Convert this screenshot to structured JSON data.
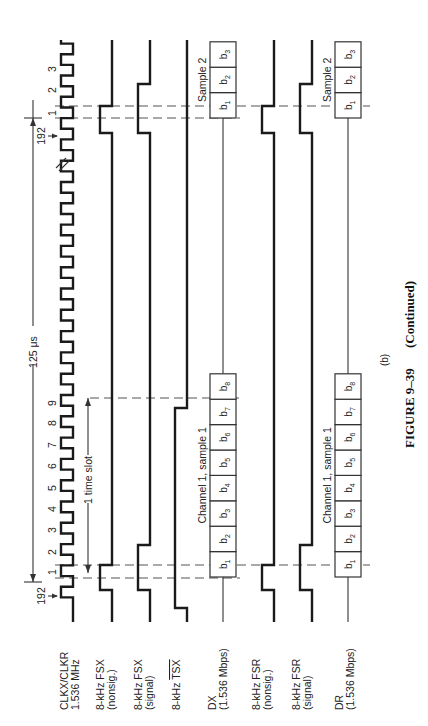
{
  "figure": {
    "caption_number": "FIGURE 9–39",
    "caption_suffix": "(Continued)",
    "part_label": "(b)",
    "orientation": "rotated 90° counter-clockwise; time increases upward"
  },
  "timing": {
    "frame_period_label": "125 μs",
    "time_slot_label": "1 time slot",
    "clock_count_start_label": "192",
    "clock_count_end_label": "192",
    "clock_numbers_slot": [
      "1",
      "2",
      "3",
      "4",
      "5",
      "6",
      "7",
      "8",
      "9"
    ],
    "clock_numbers_next": [
      "1",
      "2",
      "3"
    ]
  },
  "signals": [
    {
      "id": "clk",
      "label_line1": "CLKX/CLKR",
      "label_line2": "1.536 MHz"
    },
    {
      "id": "fsx_ns",
      "label_line1": "8-kHz FSX",
      "label_line2": "(nonsig.)"
    },
    {
      "id": "fsx_s",
      "label_line1": "8-kHz FSX",
      "label_line2": "(signal)"
    },
    {
      "id": "tsx",
      "label_line1": "8-kHz ",
      "label_line1_overline": "TSX",
      "label_line2": ""
    },
    {
      "id": "dx",
      "label_line1": "DX",
      "label_line2": "(1.536 Mbps)"
    },
    {
      "id": "fsr_ns",
      "label_line1": "8-kHz FSR",
      "label_line2": "(nonsig.)"
    },
    {
      "id": "fsr_s",
      "label_line1": "8-kHz FSR",
      "label_line2": "(signal)"
    },
    {
      "id": "dr",
      "label_line1": "DR",
      "label_line2": "(1.536 Mbps)"
    }
  ],
  "data_words": {
    "dx_sample1": {
      "label": "Channel 1, sample 1",
      "bits": [
        "1",
        "2",
        "3",
        "4",
        "5",
        "6",
        "7",
        "8"
      ],
      "bit_prefix": "b"
    },
    "dx_sample2": {
      "label": "Sample 2",
      "bits": [
        "1",
        "2",
        "3"
      ],
      "bit_prefix": "b"
    },
    "dr_sample1": {
      "label": "Channel 1, sample 1",
      "bits": [
        "1",
        "2",
        "3",
        "4",
        "5",
        "6",
        "7",
        "8"
      ],
      "bit_prefix": "b"
    },
    "dr_sample2": {
      "label": "Sample 2",
      "bits": [
        "1",
        "2",
        "3"
      ],
      "bit_prefix": "b"
    }
  }
}
